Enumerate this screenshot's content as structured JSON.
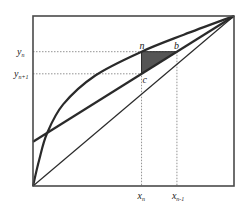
{
  "diagram": {
    "type": "mccabe-thiele-stage",
    "colors": {
      "line": "#2a2a2a",
      "frame": "#4a4a4a",
      "guide": "#777777",
      "triangle_fill": "#555555"
    },
    "axes": {
      "xlim": [
        0,
        1
      ],
      "ylim": [
        0,
        1
      ]
    },
    "equilibrium_curve": [
      [
        0,
        0
      ],
      [
        0.03,
        0.15
      ],
      [
        0.07,
        0.31
      ],
      [
        0.15,
        0.48
      ],
      [
        0.31,
        0.65
      ],
      [
        0.54,
        0.79
      ],
      [
        0.75,
        0.89
      ],
      [
        1,
        1
      ]
    ],
    "operating_line": {
      "intercept": 0.26,
      "end": [
        1,
        1
      ]
    },
    "diagonal": {
      "start": [
        0,
        0
      ],
      "end": [
        1,
        1
      ]
    },
    "points": {
      "n": {
        "label": "n",
        "x": 0.54,
        "y": 0.79
      },
      "b": {
        "label": "b",
        "x": 0.716,
        "y": 0.79
      },
      "c": {
        "label": "c",
        "x": 0.54,
        "y": 0.66
      }
    },
    "labels": {
      "y_n": {
        "main": "y",
        "sub": "n"
      },
      "y_n1": {
        "main": "y",
        "sub": "n+1"
      },
      "x_n": {
        "main": "x",
        "sub": "n"
      },
      "x_n1": {
        "main": "x",
        "sub": "n-1"
      }
    }
  }
}
